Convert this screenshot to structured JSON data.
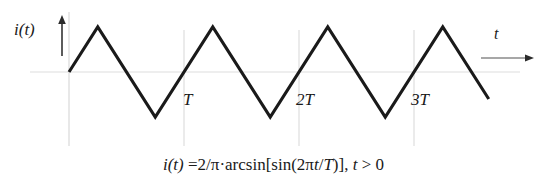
{
  "figure": {
    "background_color": "#ffffff",
    "curve_color": "#1a1a1a",
    "grid_color": "#e3e3e3",
    "axis_arrow_color": "#4a4a4a",
    "y_axis_label": "i(t)",
    "x_axis_label": "t",
    "equation_full": "i(t) =2/π·arcsin[sin(2πt/T)], t > 0",
    "equation_parts": {
      "lhs": "i(t)",
      "eq": " =2/π·arcsin[sin(2",
      "pi": "π",
      "t1": "t",
      "slash": "/",
      "T1": "T",
      "close": ")], ",
      "t2": "t",
      "cond": " > 0"
    }
  },
  "chart_data": {
    "type": "line",
    "title": "",
    "subtitle": "",
    "xlabel": "t",
    "ylabel": "i(t)",
    "legend": [],
    "legend_position": "none",
    "grid": true,
    "grid_lines_x": [
      0,
      1,
      2,
      3
    ],
    "grid_lines_y": [
      0
    ],
    "xlim": [
      -0.25,
      3.75
    ],
    "ylim": [
      -1.25,
      1.25
    ],
    "tick_labels_x": [
      "T",
      "2T",
      "3T"
    ],
    "tick_values_x": [
      1,
      2,
      3
    ],
    "tick_labels_y": [],
    "waveform": {
      "description": "Triangular wave, period T, amplitude 1, starting at 0 rising",
      "formula": "i(t) = 2/π·arcsin[sin(2πt/T)], t > 0",
      "period": 1,
      "amplitude": 1,
      "x": [
        0,
        0.25,
        0.75,
        1.25,
        1.75,
        2.25,
        2.75,
        3.25,
        3.65
      ],
      "y": [
        0,
        1,
        -1,
        1,
        -1,
        1,
        -1,
        1,
        -0.6
      ]
    },
    "series": [
      {
        "name": "i(t)",
        "x": [
          0,
          0.25,
          0.75,
          1.25,
          1.75,
          2.25,
          2.75,
          3.25,
          3.65
        ],
        "values": [
          0,
          1,
          -1,
          1,
          -1,
          1,
          -1,
          1,
          -0.6
        ]
      }
    ],
    "annotations": [
      {
        "text": "T",
        "x": 1,
        "y": -0.45
      },
      {
        "text": "2T",
        "x": 2,
        "y": -0.45
      },
      {
        "text": "3T",
        "x": 3,
        "y": -0.45
      }
    ]
  }
}
